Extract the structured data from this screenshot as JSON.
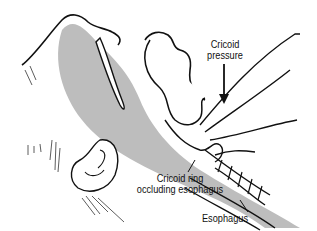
{
  "diagram": {
    "colors": {
      "line": "#111111",
      "airway_fill": "#bdbdbd",
      "background": "#ffffff"
    },
    "labels": {
      "cricoid_pressure_line1": "Cricoid",
      "cricoid_pressure_line2": "pressure",
      "cricoid_ring_line1": "Cricoid ring",
      "cricoid_ring_line2": "occluding esophagus",
      "esophagus": "Esophagus"
    }
  }
}
